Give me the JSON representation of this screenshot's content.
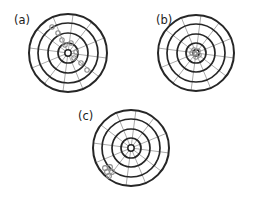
{
  "figure": {
    "type": "accuracy-precision-target-diagram",
    "background_color": "#ffffff",
    "panels": [
      {
        "id": "a",
        "label": "(a)",
        "label_x": 14,
        "label_y": 24,
        "center_x": 68,
        "center_y": 53,
        "ring_radii": [
          39,
          30,
          20,
          10,
          3.2
        ],
        "spoke_count": 12,
        "spoke_inner_radius": 3.2,
        "spoke_outer_radius": 39,
        "ring_color": "#262626",
        "spoke_color": "#8c8c8c",
        "marker_color": "#8c8c8c",
        "marker_radius": 2.2,
        "description": "scattered markers spread diagonally across the target",
        "markers": [
          {
            "x": 52,
            "y": 27
          },
          {
            "x": 58,
            "y": 33
          },
          {
            "x": 62,
            "y": 40
          },
          {
            "x": 65,
            "y": 45
          },
          {
            "x": 71,
            "y": 43
          },
          {
            "x": 76,
            "y": 52
          },
          {
            "x": 74,
            "y": 58
          },
          {
            "x": 81,
            "y": 63
          },
          {
            "x": 87,
            "y": 70
          }
        ]
      },
      {
        "id": "b",
        "label": "(b)",
        "label_x": 156,
        "label_y": 24,
        "center_x": 196,
        "center_y": 53,
        "ring_radii": [
          38,
          29,
          19,
          10,
          3.2
        ],
        "spoke_count": 12,
        "spoke_inner_radius": 3.2,
        "spoke_outer_radius": 38,
        "ring_color": "#262626",
        "spoke_color": "#8c8c8c",
        "marker_color": "#8c8c8c",
        "marker_radius": 2.2,
        "description": "markers tightly clustered at the bullseye center",
        "markers": [
          {
            "x": 194,
            "y": 50
          },
          {
            "x": 198,
            "y": 51
          },
          {
            "x": 195,
            "y": 54
          },
          {
            "x": 199,
            "y": 55
          },
          {
            "x": 196,
            "y": 57
          },
          {
            "x": 192,
            "y": 53
          }
        ]
      },
      {
        "id": "c",
        "label": "(c)",
        "label_x": 78,
        "label_y": 120,
        "center_x": 131,
        "center_y": 148,
        "ring_radii": [
          38,
          29,
          19,
          10,
          3.2
        ],
        "spoke_count": 12,
        "spoke_inner_radius": 3.2,
        "spoke_outer_radius": 38,
        "ring_color": "#262626",
        "spoke_color": "#8c8c8c",
        "marker_color": "#8c8c8c",
        "marker_radius": 2.4,
        "description": "markers tightly clustered at the lower-left edge, far from center",
        "markers": [
          {
            "x": 105,
            "y": 168
          },
          {
            "x": 110,
            "y": 167
          },
          {
            "x": 107,
            "y": 172
          },
          {
            "x": 112,
            "y": 172
          },
          {
            "x": 109,
            "y": 176
          }
        ]
      }
    ]
  }
}
